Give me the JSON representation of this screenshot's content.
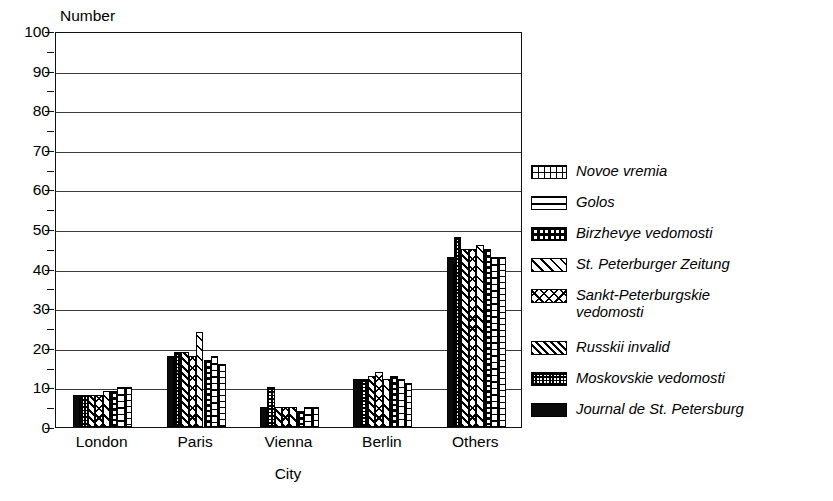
{
  "artifact": {
    "top_text": ""
  },
  "axes": {
    "y_title": "Number",
    "x_title": "City",
    "y_ticks": [
      "0",
      "10",
      "20",
      "30",
      "40",
      "50",
      "60",
      "70",
      "80",
      "90",
      "100"
    ],
    "y_min": 0,
    "y_max": 100,
    "y_major_step": 10,
    "y_minor_step": 5
  },
  "legend": {
    "items": [
      {
        "label": "Novoe vremia",
        "pattern": "grid"
      },
      {
        "label": "Golos",
        "pattern": "horizontal-lines"
      },
      {
        "label": "Birzhevye vedomosti",
        "pattern": "dots"
      },
      {
        "label": "St. Peterburger Zeitung",
        "pattern": "diagonal-lines"
      },
      {
        "label": "Sankt-Peterburgskie\nvedomosti",
        "pattern": "crosshatch"
      },
      {
        "label": "Russkii invalid",
        "pattern": "dense-diagonal"
      },
      {
        "label": "Moskovskie vedomosti",
        "pattern": "fine-dots"
      },
      {
        "label": "Journal de St. Petersburg",
        "pattern": "solid-black"
      }
    ]
  },
  "chart_data": {
    "type": "bar",
    "title": "",
    "xlabel": "City",
    "ylabel": "Number",
    "ylim": [
      0,
      100
    ],
    "grid": true,
    "legend_position": "right",
    "categories": [
      "London",
      "Paris",
      "Vienna",
      "Berlin",
      "Others"
    ],
    "series": [
      {
        "name": "Journal de St. Petersburg",
        "pattern": "solid-black",
        "values": [
          8,
          18,
          5,
          12,
          43
        ]
      },
      {
        "name": "Moskovskie vedomosti",
        "pattern": "fine-dots",
        "values": [
          8,
          19,
          10,
          12,
          48
        ]
      },
      {
        "name": "Russkii invalid",
        "pattern": "dense-diagonal",
        "values": [
          8,
          19,
          5,
          13,
          45
        ]
      },
      {
        "name": "Sankt-Peterburgskie vedomosti",
        "pattern": "crosshatch",
        "values": [
          8,
          18,
          5,
          14,
          45
        ]
      },
      {
        "name": "St. Peterburger Zeitung",
        "pattern": "diagonal-lines",
        "values": [
          9,
          24,
          5,
          12,
          46
        ]
      },
      {
        "name": "Birzhevye vedomosti",
        "pattern": "dots",
        "values": [
          9,
          17,
          4,
          13,
          45
        ]
      },
      {
        "name": "Golos",
        "pattern": "horizontal-lines",
        "values": [
          10,
          18,
          5,
          12,
          43
        ]
      },
      {
        "name": "Novoe vremia",
        "pattern": "grid",
        "values": [
          10,
          16,
          5,
          11,
          43
        ]
      }
    ]
  }
}
